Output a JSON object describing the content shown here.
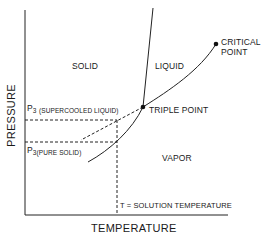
{
  "diagram": {
    "type": "phase-diagram",
    "axes": {
      "x_label": "TEMPERATURE",
      "y_label": "PRESSURE"
    },
    "regions": {
      "solid": "SOLID",
      "liquid": "LIQUID",
      "vapor": "VAPOR"
    },
    "points": {
      "critical_point": "CRITICAL",
      "critical_point_line2": "POINT",
      "triple_point": "TRIPLE POINT"
    },
    "pressure_labels": {
      "p3_supercooled": {
        "symbol": "P",
        "subscript": "3",
        "qualifier": "(SUPERCOOLED LIQUID)"
      },
      "p3_pure_solid": {
        "symbol": "P",
        "subscript": "3",
        "qualifier": "(PURE SOLID)"
      }
    },
    "temperature_label": "T = SOLUTION TEMPERATURE"
  }
}
